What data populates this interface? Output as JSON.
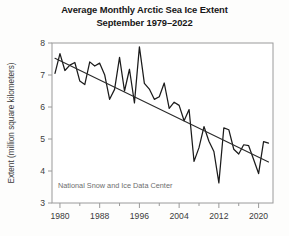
{
  "chart_data": {
    "type": "line",
    "title": "Average Monthly Arctic Sea Ice Extent",
    "subtitle": "September 1979–2022",
    "xlabel": "",
    "ylabel": "Extent (million square kilometers)",
    "xlim": [
      1978.4,
      2022.9
    ],
    "ylim": [
      3,
      8
    ],
    "yticks": [
      3,
      4,
      5,
      6,
      7,
      8
    ],
    "ytick_labels": [
      "3",
      "4",
      "5",
      "6",
      "7",
      "8"
    ],
    "xticks": [
      1980,
      1988,
      1996,
      2004,
      2012,
      2020
    ],
    "xtick_labels": [
      "1980",
      "1988",
      "1996",
      "2004",
      "2012",
      "2020"
    ],
    "xminor_ticks": [
      1984,
      1992,
      2000,
      2008,
      2016
    ],
    "grid": false,
    "legend": null,
    "annotation": "National Snow and Ice Data Center",
    "series": [
      {
        "name": "September sea ice extent",
        "color": "#1b1b1b",
        "x": [
          1979,
          1980,
          1981,
          1982,
          1983,
          1984,
          1985,
          1986,
          1987,
          1988,
          1989,
          1990,
          1991,
          1992,
          1993,
          1994,
          1995,
          1996,
          1997,
          1998,
          1999,
          2000,
          2001,
          2002,
          2003,
          2004,
          2005,
          2006,
          2007,
          2008,
          2009,
          2010,
          2011,
          2012,
          2013,
          2014,
          2015,
          2016,
          2017,
          2018,
          2019,
          2020,
          2021,
          2022
        ],
        "values": [
          7.05,
          7.67,
          7.14,
          7.31,
          7.39,
          6.81,
          6.7,
          7.41,
          7.28,
          7.37,
          7.01,
          6.24,
          6.55,
          7.55,
          6.5,
          7.18,
          6.13,
          7.88,
          6.74,
          6.56,
          6.24,
          6.32,
          6.75,
          5.96,
          6.15,
          6.05,
          5.57,
          5.92,
          4.3,
          4.73,
          5.39,
          4.93,
          4.61,
          3.63,
          5.35,
          5.29,
          4.68,
          4.53,
          4.82,
          4.79,
          4.36,
          3.92,
          4.92,
          4.87
        ]
      },
      {
        "name": "Linear trend",
        "color": "#2a2a2a",
        "x": [
          1979,
          2022
        ],
        "values": [
          7.52,
          4.28
        ]
      }
    ]
  }
}
